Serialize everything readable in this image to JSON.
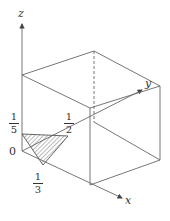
{
  "diagram": {
    "type": "3d-coordinate-cube-with-shaded-triangle",
    "axes": {
      "x": "x",
      "y": "y",
      "z": "z"
    },
    "origin_label": "0",
    "intercepts": {
      "x": {
        "num": "1",
        "den": "3"
      },
      "y": {
        "num": "1",
        "den": "2"
      },
      "z": {
        "num": "1",
        "den": "5"
      }
    },
    "colors": {
      "line": "#555555",
      "hatch": "#555555"
    }
  }
}
